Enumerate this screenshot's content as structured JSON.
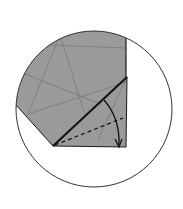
{
  "diagram": {
    "type": "origami-fold-step",
    "colors": {
      "background": "#ffffff",
      "paper": "#9a9a9a",
      "crease": "#7a7a7a",
      "outline": "#1a1a1a"
    },
    "circle": {
      "cx": 94,
      "cy": 109,
      "r": 78
    },
    "fold_arrow": {
      "direction": "down",
      "label": ""
    }
  }
}
